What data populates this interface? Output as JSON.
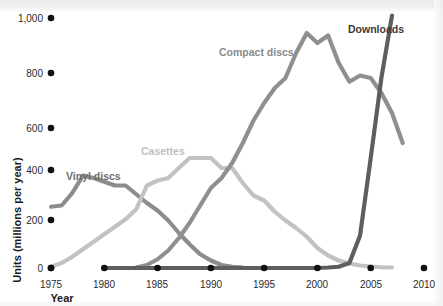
{
  "chart_data": {
    "type": "line",
    "title": "",
    "xlabel": "Year",
    "ylabel": "Units (millions per year)",
    "xlim": [
      1975,
      2010
    ],
    "ylim": [
      0,
      1000
    ],
    "xticks": [
      1975,
      1980,
      1985,
      1990,
      1995,
      2000,
      2005,
      2010
    ],
    "xtick_labels": [
      "1975",
      "1980",
      "1985",
      "1990",
      "1995",
      "2000",
      "2005",
      "2010"
    ],
    "yticks": [
      0,
      200,
      400,
      600,
      800,
      1000
    ],
    "ytick_labels": [
      "0",
      "200",
      "400",
      "600",
      "800",
      "1,000"
    ],
    "grid": false,
    "legend": "inline-labels",
    "tick_marker_style": "filled-circle",
    "series": [
      {
        "name": "Vinyl discs",
        "color": "#8c8c8c",
        "label_x": 1978.2,
        "label_y": 430,
        "x": [
          1975,
          1976,
          1977,
          1978,
          1979,
          1980,
          1981,
          1982,
          1983,
          1984,
          1985,
          1986,
          1987,
          1988,
          1989,
          1990,
          1991,
          1992,
          1993
        ],
        "values": [
          245,
          250,
          300,
          370,
          360,
          345,
          330,
          330,
          295,
          260,
          230,
          190,
          140,
          95,
          55,
          30,
          12,
          5,
          2
        ]
      },
      {
        "name": "Casettes",
        "color": "#c2c2c2",
        "label_x": 1984.2,
        "label_y": 480,
        "x": [
          1975,
          1976,
          1977,
          1978,
          1979,
          1980,
          1981,
          1982,
          1983,
          1984,
          1985,
          1986,
          1987,
          1988,
          1989,
          1990,
          1991,
          1992,
          1993,
          1994,
          1995,
          1996,
          1997,
          1998,
          1999,
          2000,
          2001,
          2002,
          2003,
          2004,
          2005,
          2006,
          2007
        ],
        "values": [
          5,
          20,
          45,
          75,
          105,
          135,
          165,
          195,
          235,
          330,
          350,
          360,
          400,
          440,
          440,
          440,
          400,
          400,
          340,
          290,
          270,
          225,
          190,
          160,
          125,
          80,
          50,
          30,
          18,
          10,
          6,
          3,
          2
        ]
      },
      {
        "name": "Compact discs",
        "color": "#8f8f8f",
        "label_x": 1992.0,
        "label_y": 840,
        "x": [
          1983,
          1984,
          1985,
          1986,
          1987,
          1988,
          1989,
          1990,
          1991,
          1992,
          1993,
          1994,
          1995,
          1996,
          1997,
          1998,
          1999,
          2000,
          2001,
          2002,
          2003,
          2004,
          2005,
          2006,
          2007,
          2008
        ],
        "values": [
          2,
          12,
          35,
          70,
          120,
          180,
          250,
          320,
          360,
          420,
          500,
          590,
          660,
          720,
          760,
          860,
          940,
          900,
          930,
          820,
          745,
          770,
          760,
          700,
          620,
          500
        ]
      },
      {
        "name": "Downloads",
        "color": "#5e5e5e",
        "label_x": 2004.6,
        "label_y": 1000,
        "x": [
          1980,
          1985,
          1990,
          1995,
          2000,
          2001,
          2002,
          2003,
          2004,
          2005,
          2006,
          2007
        ],
        "values": [
          0,
          0,
          0,
          0,
          0,
          2,
          5,
          20,
          130,
          440,
          760,
          1010
        ]
      }
    ]
  }
}
